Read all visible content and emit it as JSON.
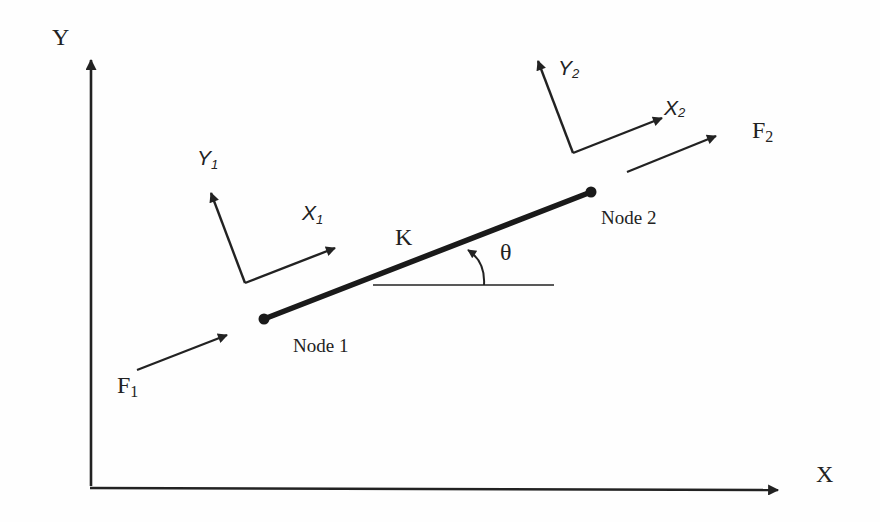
{
  "diagram": {
    "global_axes": {
      "x_label": "X",
      "y_label": "Y"
    },
    "element": {
      "stiffness_label": "K",
      "angle_label": "θ",
      "node1_label": "Node 1",
      "node2_label": "Node 2"
    },
    "local_frame_1": {
      "x_label": "X",
      "x_sub": "1",
      "y_label": "Y",
      "y_sub": "1"
    },
    "local_frame_2": {
      "x_label": "X",
      "x_sub": "2",
      "y_label": "Y",
      "y_sub": "2"
    },
    "forces": {
      "f1_label": "F",
      "f1_sub": "1",
      "f2_label": "F",
      "f2_sub": "2"
    },
    "colors": {
      "ink": "#222222",
      "background": "#fefefe"
    }
  }
}
